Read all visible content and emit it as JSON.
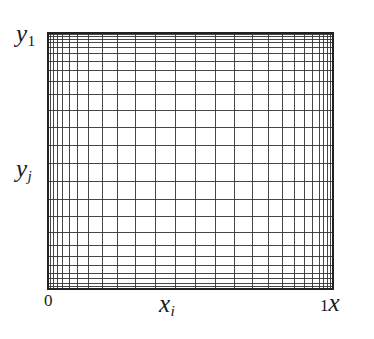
{
  "figure": {
    "kind": "stretched-cartesian-mesh",
    "background_color": "#ffffff",
    "line_color": "#333333",
    "border_color": "#222222"
  },
  "labels": {
    "y_top": {
      "base": "y",
      "sub": "1"
    },
    "y_mid": {
      "base": "y",
      "sub": "j"
    },
    "x_origin": "0",
    "x_mid": {
      "base": "x",
      "sub": "i"
    },
    "x_end_value": "1",
    "x_axis_name": "x"
  },
  "chart_data": {
    "type": "line",
    "title": "",
    "xlabel": "x",
    "ylabel": "y",
    "xlim": [
      0,
      1
    ],
    "ylim": [
      0,
      1
    ],
    "grid": true,
    "legend": "none",
    "tick_labels": {
      "x": [
        "0",
        "1"
      ],
      "y": [
        "y_j",
        "y_1"
      ]
    },
    "annotations": [
      "y_1",
      "y_j",
      "0",
      "x_i",
      "1",
      "x"
    ],
    "plot_box_px": {
      "left": 48,
      "top": 33,
      "right": 333,
      "bottom": 289
    },
    "series": [
      {
        "name": "vertical-grid-lines",
        "orientation": "vertical",
        "note": "normalized x positions of vertical mesh lines (0 = left edge, 1 = right edge)",
        "values": [
          0.0,
          0.009,
          0.02,
          0.034,
          0.052,
          0.075,
          0.105,
          0.143,
          0.19,
          0.245,
          0.308,
          0.376,
          0.447,
          0.518,
          0.588,
          0.655,
          0.718,
          0.775,
          0.824,
          0.866,
          0.901,
          0.929,
          0.951,
          0.968,
          0.981,
          0.991,
          1.0
        ]
      },
      {
        "name": "horizontal-grid-lines",
        "orientation": "horizontal",
        "note": "normalized y positions of horizontal mesh lines (0 = bottom edge, 1 = top edge)",
        "values": [
          0.0,
          0.01,
          0.023,
          0.04,
          0.062,
          0.09,
          0.126,
          0.17,
          0.222,
          0.282,
          0.348,
          0.418,
          0.49,
          0.562,
          0.632,
          0.698,
          0.758,
          0.81,
          0.854,
          0.89,
          0.92,
          0.944,
          0.962,
          0.976,
          0.987,
          0.995,
          1.0
        ]
      }
    ]
  }
}
